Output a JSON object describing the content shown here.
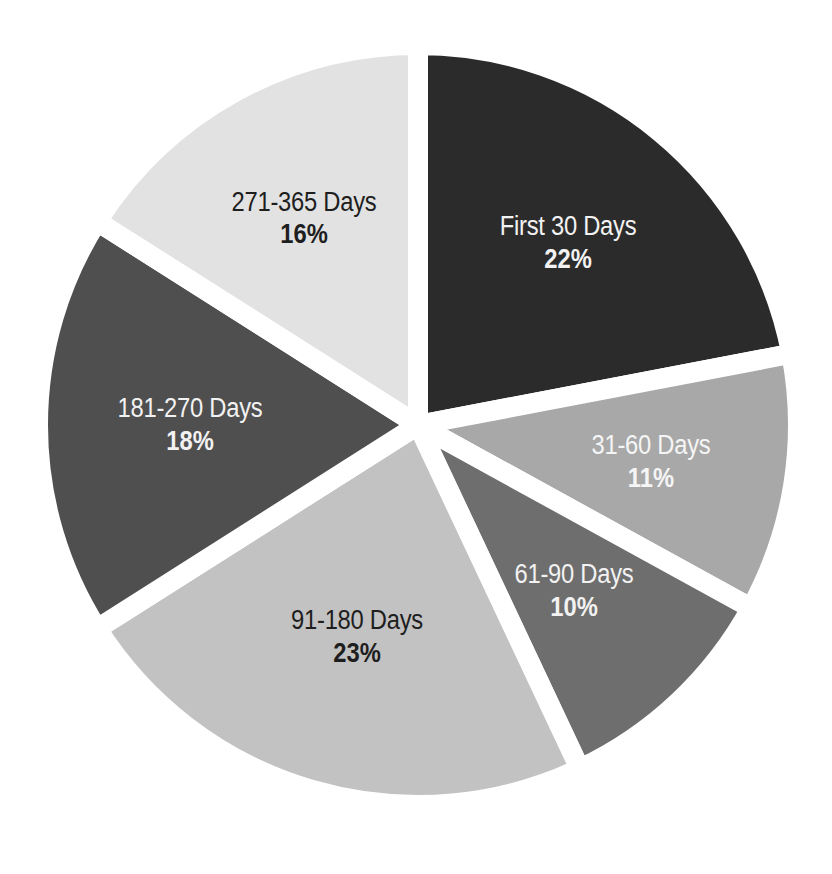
{
  "chart_data": {
    "type": "pie",
    "title": "",
    "categories": [
      "First 30 Days",
      "31-60 Days",
      "61-90 Days",
      "91-180 Days",
      "181-270 Days",
      "271-365 Days"
    ],
    "values": [
      22,
      11,
      10,
      23,
      18,
      16
    ],
    "unit": "%",
    "start_angle_deg": 0,
    "direction": "clockwise",
    "legend": "none",
    "data_labels": "inside (category + percent)",
    "slices": [
      {
        "label": "First 30 Days",
        "value": 22,
        "pct_text": "22%",
        "color": "#2b2b2b",
        "text_color": "#f2f2f2"
      },
      {
        "label": "31-60 Days",
        "value": 11,
        "pct_text": "11%",
        "color": "#a8a8a8",
        "text_color": "#f5f5f5"
      },
      {
        "label": "61-90 Days",
        "value": 10,
        "pct_text": "10%",
        "color": "#6e6e6e",
        "text_color": "#f2f2f2"
      },
      {
        "label": "91-180 Days",
        "value": 23,
        "pct_text": "23%",
        "color": "#c2c2c2",
        "text_color": "#1e1e1e"
      },
      {
        "label": "181-270 Days",
        "value": 18,
        "pct_text": "18%",
        "color": "#4f4f4f",
        "text_color": "#f2f2f2"
      },
      {
        "label": "271-365 Days",
        "value": 16,
        "pct_text": "16%",
        "color": "#e2e2e2",
        "text_color": "#1e1e1e"
      }
    ]
  },
  "labels": [
    {
      "name": "First 30 Days",
      "pct": "22%"
    },
    {
      "name": "31-60 Days",
      "pct": "11%"
    },
    {
      "name": "61-90 Days",
      "pct": "10%"
    },
    {
      "name": "91-180 Days",
      "pct": "23%"
    },
    {
      "name": "181-270 Days",
      "pct": "18%"
    },
    {
      "name": "271-365 Days",
      "pct": "16%"
    }
  ]
}
